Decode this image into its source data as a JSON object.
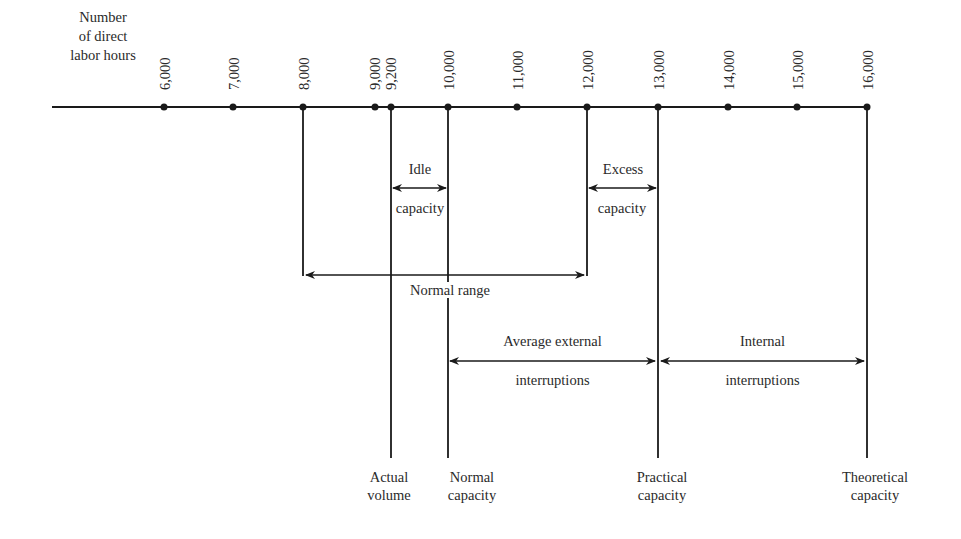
{
  "axis": {
    "title_lines": [
      "Number",
      "of direct",
      "labor hours"
    ],
    "ticks": [
      {
        "value": 6000,
        "label": "6,000",
        "x": 164
      },
      {
        "value": 7000,
        "label": "7,000",
        "x": 233
      },
      {
        "value": 8000,
        "label": "8,000",
        "x": 303
      },
      {
        "value": 9000,
        "label": "9,000",
        "x": 375
      },
      {
        "value": 9200,
        "label": "9,200",
        "x": 391
      },
      {
        "value": 10000,
        "label": "10,000",
        "x": 448
      },
      {
        "value": 11000,
        "label": "11,000",
        "x": 517
      },
      {
        "value": 12000,
        "label": "12,000",
        "x": 587
      },
      {
        "value": 13000,
        "label": "13,000",
        "x": 658
      },
      {
        "value": 14000,
        "label": "14,000",
        "x": 728
      },
      {
        "value": 15000,
        "label": "15,000",
        "x": 797
      },
      {
        "value": 16000,
        "label": "16,000",
        "x": 867
      }
    ]
  },
  "spans": {
    "idle_capacity": {
      "line1": "Idle",
      "line2": "capacity",
      "from": 9200,
      "to": 10000
    },
    "excess_capacity": {
      "line1": "Excess",
      "line2": "capacity",
      "from": 12000,
      "to": 13000
    },
    "normal_range": {
      "label": "Normal range",
      "from": 8000,
      "to": 12000
    },
    "average_external_interruptions": {
      "line1": "Average external",
      "line2": "interruptions",
      "from": 10000,
      "to": 13000
    },
    "internal_interruptions": {
      "line1": "Internal",
      "line2": "interruptions",
      "from": 13000,
      "to": 16000
    }
  },
  "markers": {
    "actual_volume": {
      "line1": "Actual",
      "line2": "volume",
      "value": 9200
    },
    "normal_capacity": {
      "line1": "Normal",
      "line2": "capacity",
      "value": 10000
    },
    "practical_capacity": {
      "line1": "Practical",
      "line2": "capacity",
      "value": 13000
    },
    "theoretical_capacity": {
      "line1": "Theoretical",
      "line2": "capacity",
      "value": 16000
    }
  },
  "colors": {
    "ink": "#1a1a1a",
    "background": "#ffffff"
  }
}
